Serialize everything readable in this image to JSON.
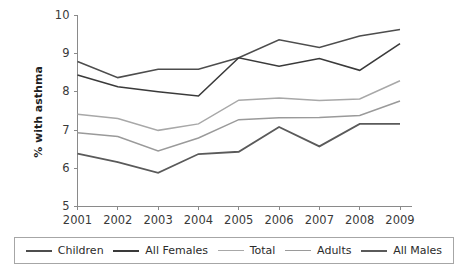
{
  "chart_data": {
    "type": "line",
    "title": "",
    "xlabel": "",
    "ylabel": "% with asthma",
    "categories": [
      "2001",
      "2002",
      "2003",
      "2004",
      "2005",
      "2006",
      "2007",
      "2008",
      "2009"
    ],
    "xlim": [
      2001,
      2009
    ],
    "ylim": [
      5,
      10
    ],
    "yticks": [
      "5",
      "6",
      "7",
      "8",
      "9",
      "10"
    ],
    "grid": false,
    "legend_position": "bottom",
    "series": [
      {
        "name": "Children",
        "color": "#4d4d4d",
        "width": 1.6,
        "values": [
          8.78,
          8.36,
          8.58,
          8.58,
          8.88,
          9.35,
          9.15,
          9.45,
          9.62
        ]
      },
      {
        "name": "All Females",
        "color": "#3a3a3a",
        "width": 1.6,
        "values": [
          8.43,
          8.12,
          7.99,
          7.88,
          8.88,
          8.66,
          8.86,
          8.55,
          9.25
        ]
      },
      {
        "name": "Total",
        "color": "#a8a8a8",
        "width": 1.5,
        "values": [
          7.4,
          7.29,
          6.98,
          7.15,
          7.77,
          7.83,
          7.76,
          7.8,
          8.28
        ]
      },
      {
        "name": "Adults",
        "color": "#9a9a9a",
        "width": 1.5,
        "values": [
          6.92,
          6.82,
          6.44,
          6.78,
          7.26,
          7.31,
          7.32,
          7.37,
          7.75
        ]
      },
      {
        "name": "All Males",
        "color": "#5a5a5a",
        "width": 1.8,
        "values": [
          6.37,
          6.15,
          5.87,
          6.36,
          6.42,
          7.07,
          6.56,
          7.15,
          7.15
        ]
      }
    ]
  },
  "legend": {
    "items": [
      {
        "label": "Children",
        "color": "#4d4d4d",
        "width": "2px"
      },
      {
        "label": "All Females",
        "color": "#3a3a3a",
        "width": "2px"
      },
      {
        "label": "Total",
        "color": "#a8a8a8",
        "width": "1.5px"
      },
      {
        "label": "Adults",
        "color": "#9a9a9a",
        "width": "1.5px"
      },
      {
        "label": "All Males",
        "color": "#5a5a5a",
        "width": "2.5px"
      }
    ]
  }
}
